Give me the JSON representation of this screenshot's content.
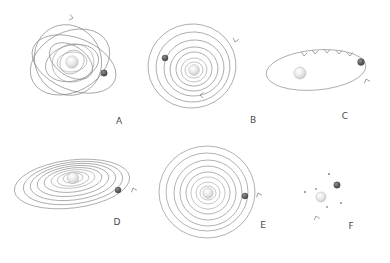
{
  "figure": {
    "background_color": "#ffffff",
    "line_color": "#7d7d7d",
    "star_color": "#e8e8e8",
    "planet_color": "#5a5a5a",
    "label_color": "#4a4a4a",
    "width": 390,
    "height": 263
  },
  "panels": [
    {
      "id": "A",
      "label": "A",
      "label_x": 119,
      "label_y": 124,
      "center_x": 72,
      "center_y": 62,
      "architecture": "mutually-inclined-eccentric",
      "orbit_count": 8,
      "planet_count": 1,
      "star": {
        "cx": 72,
        "cy": 62,
        "r": 6.2
      },
      "planets": [
        {
          "cx": 104,
          "cy": 73,
          "r": 3.2
        }
      ],
      "arrows": [
        {
          "x": 73,
          "y": 18,
          "angle": 12
        }
      ],
      "orbits": [
        {
          "rx": 42,
          "ry": 30,
          "rot": -28,
          "cx": 70,
          "cy": 62
        },
        {
          "rx": 44,
          "ry": 26,
          "rot": 22,
          "cx": 74,
          "cy": 64
        },
        {
          "rx": 36,
          "ry": 33,
          "rot": 62,
          "cx": 68,
          "cy": 60
        },
        {
          "rx": 27,
          "ry": 18,
          "rot": -14,
          "cx": 72,
          "cy": 63
        },
        {
          "rx": 24,
          "ry": 15,
          "rot": 34,
          "cx": 71,
          "cy": 61
        },
        {
          "rx": 19,
          "ry": 21,
          "rot": 74,
          "cx": 73,
          "cy": 63
        },
        {
          "rx": 15,
          "ry": 10,
          "rot": -6,
          "cx": 72,
          "cy": 62
        },
        {
          "rx": 11,
          "ry": 13,
          "rot": 48,
          "cx": 72,
          "cy": 62
        }
      ]
    },
    {
      "id": "B",
      "label": "B",
      "label_x": 253,
      "label_y": 123,
      "center_x": 194,
      "center_y": 66,
      "architecture": "compact-coplanar-circular",
      "orbit_count": 7,
      "planet_count": 1,
      "star": {
        "cx": 194,
        "cy": 70,
        "r": 5.4
      },
      "planets": [
        {
          "cx": 165,
          "cy": 58,
          "r": 3.0
        }
      ],
      "arrows": [
        {
          "x": 235,
          "y": 42,
          "angle": 105
        },
        {
          "x": 200,
          "y": 95,
          "angle": 186
        }
      ],
      "orbits": [
        {
          "rx": 44,
          "ry": 42,
          "rot": -8,
          "cx": 192,
          "cy": 66
        },
        {
          "rx": 37,
          "ry": 35,
          "rot": -8,
          "cx": 193,
          "cy": 67
        },
        {
          "rx": 30,
          "ry": 28,
          "rot": -8,
          "cx": 194,
          "cy": 68
        },
        {
          "rx": 24,
          "ry": 22,
          "rot": -8,
          "cx": 194,
          "cy": 69
        },
        {
          "rx": 18,
          "ry": 17,
          "rot": -8,
          "cx": 194,
          "cy": 69
        },
        {
          "rx": 13,
          "ry": 12,
          "rot": -8,
          "cx": 194,
          "cy": 70
        },
        {
          "rx": 9,
          "ry": 8,
          "rot": -8,
          "cx": 194,
          "cy": 70
        }
      ]
    },
    {
      "id": "C",
      "label": "C",
      "label_x": 345,
      "label_y": 119,
      "center_x": 318,
      "center_y": 70,
      "architecture": "single-eccentric-edge-on",
      "orbit_count": 1,
      "planet_count": 1,
      "star": {
        "cx": 300,
        "cy": 73,
        "r": 6.0
      },
      "planets": [
        {
          "cx": 361,
          "cy": 62,
          "r": 3.4
        }
      ],
      "arrows": [
        {
          "x": 304,
          "y": 56,
          "angle": 96
        },
        {
          "x": 315,
          "y": 54,
          "angle": 94
        },
        {
          "x": 327,
          "y": 53,
          "angle": 92
        },
        {
          "x": 339,
          "y": 54,
          "angle": 90
        },
        {
          "x": 350,
          "y": 56,
          "angle": 86
        },
        {
          "x": 366,
          "y": 79,
          "angle": 250
        }
      ],
      "orbits": [
        {
          "rx": 50,
          "ry": 20,
          "rot": -5,
          "cx": 316,
          "cy": 70
        }
      ]
    },
    {
      "id": "D",
      "label": "D",
      "label_x": 117,
      "label_y": 225,
      "center_x": 76,
      "center_y": 182,
      "architecture": "coplanar-inclined-disk",
      "orbit_count": 8,
      "planet_count": 1,
      "star": {
        "cx": 73,
        "cy": 178,
        "r": 5.6
      },
      "planets": [
        {
          "cx": 118,
          "cy": 190,
          "r": 3.0
        }
      ],
      "arrows": [
        {
          "x": 133,
          "y": 188,
          "angle": 250
        }
      ],
      "orbits": [
        {
          "rx": 58,
          "ry": 24,
          "rot": -7,
          "cx": 72,
          "cy": 184
        },
        {
          "rx": 50,
          "ry": 21,
          "rot": -7,
          "cx": 73,
          "cy": 183
        },
        {
          "rx": 43,
          "ry": 18,
          "rot": -7,
          "cx": 73,
          "cy": 182
        },
        {
          "rx": 36,
          "ry": 15,
          "rot": -7,
          "cx": 73,
          "cy": 181
        },
        {
          "rx": 29,
          "ry": 12,
          "rot": -7,
          "cx": 73,
          "cy": 180
        },
        {
          "rx": 22,
          "ry": 9,
          "rot": -7,
          "cx": 73,
          "cy": 179
        },
        {
          "rx": 16,
          "ry": 7,
          "rot": -7,
          "cx": 73,
          "cy": 179
        },
        {
          "rx": 10,
          "ry": 5,
          "rot": -7,
          "cx": 73,
          "cy": 178
        }
      ]
    },
    {
      "id": "E",
      "label": "E",
      "label_x": 263,
      "label_y": 228,
      "center_x": 208,
      "center_y": 193,
      "architecture": "coplanar-circular-face-on",
      "orbit_count": 8,
      "planet_count": 1,
      "star": {
        "cx": 208,
        "cy": 193,
        "r": 5.2
      },
      "planets": [
        {
          "cx": 245,
          "cy": 196,
          "r": 3.0
        }
      ],
      "arrows": [
        {
          "x": 258,
          "y": 193,
          "angle": 250
        }
      ],
      "orbits": [
        {
          "rx": 48,
          "ry": 46,
          "rot": 0,
          "cx": 207,
          "cy": 192
        },
        {
          "rx": 41,
          "ry": 39,
          "rot": 0,
          "cx": 207,
          "cy": 192
        },
        {
          "rx": 34,
          "ry": 33,
          "rot": 0,
          "cx": 208,
          "cy": 193
        },
        {
          "rx": 28,
          "ry": 27,
          "rot": 0,
          "cx": 208,
          "cy": 193
        },
        {
          "rx": 22,
          "ry": 21,
          "rot": 0,
          "cx": 208,
          "cy": 193
        },
        {
          "rx": 17,
          "ry": 16,
          "rot": 0,
          "cx": 208,
          "cy": 193
        },
        {
          "rx": 12,
          "ry": 11,
          "rot": 0,
          "cx": 208,
          "cy": 193
        },
        {
          "rx": 8,
          "ry": 7,
          "rot": 0,
          "cx": 208,
          "cy": 193
        }
      ]
    },
    {
      "id": "F",
      "label": "F",
      "label_x": 351,
      "label_y": 229,
      "center_x": 325,
      "center_y": 195,
      "architecture": "no-detected-orbits-scattered",
      "orbit_count": 0,
      "planet_count": 1,
      "star": {
        "cx": 321,
        "cy": 197,
        "r": 5.0
      },
      "planets": [
        {
          "cx": 337,
          "cy": 185,
          "r": 3.2
        }
      ],
      "arrows": [
        {
          "x": 316,
          "y": 216,
          "angle": 255
        }
      ],
      "orbits": [],
      "dots": [
        {
          "cx": 329,
          "cy": 174,
          "r": 1.1
        },
        {
          "cx": 305,
          "cy": 192,
          "r": 1.1
        },
        {
          "cx": 316,
          "cy": 189,
          "r": 0.9
        },
        {
          "cx": 341,
          "cy": 203,
          "r": 1.0
        },
        {
          "cx": 327,
          "cy": 207,
          "r": 0.9
        }
      ]
    }
  ]
}
